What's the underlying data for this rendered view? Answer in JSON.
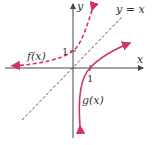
{
  "diagram": {
    "labels": {
      "x_axis": "x",
      "y_axis": "y",
      "identity_line": "y = x",
      "f": "f(x)",
      "g": "g(x)",
      "x_tick": "1",
      "y_tick": "1"
    },
    "colors": {
      "axis": "#444444",
      "curve": "#d4316a",
      "identity_line": "#444444"
    },
    "curves": [
      {
        "name": "f(x)",
        "style": "dashed",
        "description": "exponential-like curve passing through (0,1), approaching y=0 as x→-∞"
      },
      {
        "name": "g(x)",
        "style": "solid",
        "description": "logarithmic-like curve passing through (1,0), approaching x=0 as x→0+"
      },
      {
        "name": "y = x",
        "style": "dashed",
        "description": "line of symmetry"
      }
    ]
  }
}
